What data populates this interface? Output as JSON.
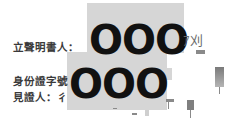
{
  "document": {
    "fields": [
      {
        "label": "立聲明書人："
      },
      {
        "label": "身份證字號"
      },
      {
        "label": "見證人：彳"
      }
    ],
    "redactions": [
      {
        "text": "OOO"
      },
      {
        "text": "OOO"
      }
    ],
    "signature_fragments": {
      "handwriting": "ｱ刈"
    },
    "colors": {
      "redaction_box": "#d6d6d6",
      "redaction_text": "#111111",
      "label_text": "#3a3a3a"
    }
  }
}
